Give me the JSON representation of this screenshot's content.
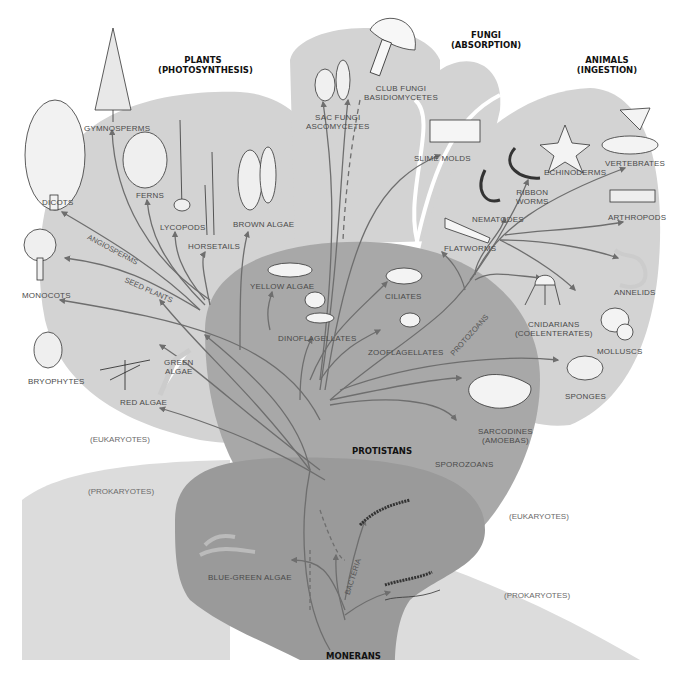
{
  "colors": {
    "background": "#ffffff",
    "prokaryote_bg": "#dcdcdc",
    "eukaryote_kingdoms": "#d3d3d3",
    "protistans": "#a8a8a8",
    "monerans": "#9a9a9a",
    "branch": "#6e6e6e",
    "label_text": "#4a4a4a",
    "kingdom_text": "#111111"
  },
  "kingdoms": {
    "plants": {
      "line1": "PLANTS",
      "line2": "(PHOTOSYNTHESIS)"
    },
    "fungi": {
      "line1": "FUNGI",
      "line2": "(ABSORPTION)"
    },
    "animals": {
      "line1": "ANIMALS",
      "line2": "(INGESTION)"
    },
    "protistans": {
      "line1": "PROTISTANS"
    },
    "monerans": {
      "line1": "MONERANS"
    }
  },
  "domains": {
    "eukaryotes_left": "(EUKARYOTES)",
    "prokaryotes_left": "(PROKARYOTES)",
    "eukaryotes_right": "(EUKARYOTES)",
    "prokaryotes_right": "(PROKARYOTES)"
  },
  "branch_labels": {
    "angiosperms": "ANGIOSPERMS",
    "seed_plants": "SEED PLANTS",
    "protozoans": "PROTOZOANS",
    "bacteria": "BACTERIA"
  },
  "plants": [
    {
      "id": "gymnosperms",
      "label": "GYMNOSPERMS"
    },
    {
      "id": "dicots",
      "label": "DICOTS"
    },
    {
      "id": "ferns",
      "label": "FERNS"
    },
    {
      "id": "lycopods",
      "label": "LYCOPODS"
    },
    {
      "id": "horsetails",
      "label": "HORSETAILS"
    },
    {
      "id": "brown-algae",
      "label": "BROWN ALGAE"
    },
    {
      "id": "monocots",
      "label": "MONOCOTS"
    },
    {
      "id": "bryophytes",
      "label": "BRYOPHYTES"
    },
    {
      "id": "green-algae",
      "label1": "GREEN",
      "label2": "ALGAE"
    },
    {
      "id": "red-algae",
      "label": "RED ALGAE"
    }
  ],
  "fungi": [
    {
      "id": "sac-fungi",
      "label1": "SAC FUNGI",
      "label2": "ASCOMYCETES"
    },
    {
      "id": "club-fungi",
      "label1": "CLUB FUNGI",
      "label2": "BASIDIOMYCETES"
    },
    {
      "id": "slime-molds",
      "label": "SLIME MOLDS"
    }
  ],
  "animals": [
    {
      "id": "echinoderms",
      "label": "ECHINODERMS"
    },
    {
      "id": "vertebrates",
      "label": "VERTEBRATES"
    },
    {
      "id": "ribbon-worms",
      "label1": "RIBBON",
      "label2": "WORMS"
    },
    {
      "id": "nematodes",
      "label": "NEMATODES"
    },
    {
      "id": "arthropods",
      "label": "ARTHROPODS"
    },
    {
      "id": "flatworms",
      "label": "FLATWORMS"
    },
    {
      "id": "annelids",
      "label": "ANNELIDS"
    },
    {
      "id": "cnidarians",
      "label1": "CNIDARIANS",
      "label2": "(COELENTERATES)"
    },
    {
      "id": "molluscs",
      "label": "MOLLUSCS"
    },
    {
      "id": "sponges",
      "label": "SPONGES"
    }
  ],
  "protists": [
    {
      "id": "yellow-algae",
      "label": "YELLOW  ALGAE"
    },
    {
      "id": "dinoflagellates",
      "label": "DINOFLAGELLATES"
    },
    {
      "id": "ciliates",
      "label": "CILIATES"
    },
    {
      "id": "zooflagellates",
      "label": "ZOOFLAGELLATES"
    },
    {
      "id": "sarcodines",
      "label1": "SARCODINES",
      "label2": "(AMOEBAS)"
    },
    {
      "id": "sporozoans",
      "label": "SPOROZOANS"
    }
  ],
  "monerans": [
    {
      "id": "blue-green-algae",
      "label": "BLUE-GREEN ALGAE"
    }
  ]
}
